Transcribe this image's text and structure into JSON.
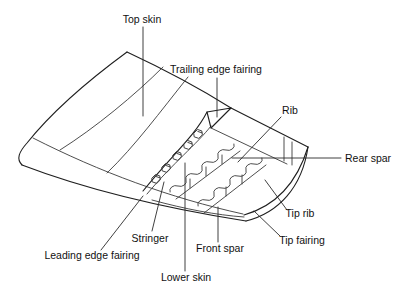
{
  "diagram": {
    "type": "wing-structure-cutaway",
    "colors": {
      "background": "#ffffff",
      "line": "#1f1f1f",
      "text": "#111111"
    },
    "labels": {
      "top_skin": "Top skin",
      "trailing_edge_fairing": "Trailing edge fairing",
      "rib": "Rib",
      "rear_spar": "Rear spar",
      "tip_rib": "Tip rib",
      "tip_fairing": "Tip fairing",
      "front_spar": "Front spar",
      "lower_skin": "Lower skin",
      "stringer": "Stringer",
      "leading_edge_fairing": "Leading edge fairing"
    }
  }
}
